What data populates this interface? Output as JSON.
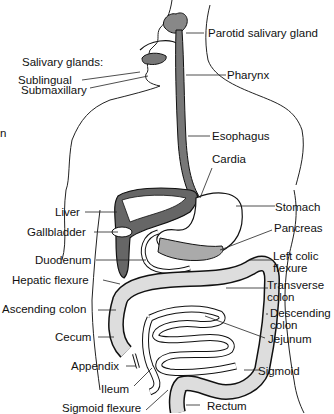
{
  "diagram": {
    "partial_left_text": "n",
    "labels": {
      "parotid": "Parotid salivary gland",
      "salivary_glands": "Salivary glands:",
      "sublingual": "Sublingual",
      "submaxillary": "Submaxillary",
      "pharynx": "Pharynx",
      "esophagus": "Esophagus",
      "cardia": "Cardia",
      "stomach": "Stomach",
      "liver": "Liver",
      "gallbladder": "Gallbladder",
      "pancreas": "Pancreas",
      "duodenum": "Duodenum",
      "left_colic_1": "Left colic",
      "left_colic_2": "flexure",
      "hepatic_flexure": "Hepatic flexure",
      "transverse_1": "Transverse",
      "transverse_2": "colon",
      "ascending_colon": "Ascending colon",
      "descending_1": "Descending",
      "descending_2": "colon",
      "cecum": "Cecum",
      "jejunum": "Jejunum",
      "appendix": "Appendix",
      "sigmoid": "Sigmoid",
      "ileum": "Ileum",
      "rectum": "Rectum",
      "sigmoid_flexure": "Sigmoid flexure"
    }
  }
}
